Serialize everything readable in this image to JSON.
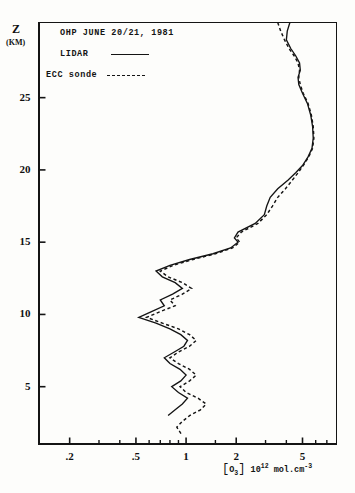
{
  "figure": {
    "y_axis_title": "Z",
    "y_axis_unit": "(KM)",
    "x_axis_caption_species": "O",
    "x_axis_caption_sub": "3",
    "x_axis_caption_factor": "10",
    "x_axis_caption_exp": "12",
    "x_axis_caption_units": "mol.cm",
    "x_axis_caption_units_exp": "-3"
  },
  "legend": {
    "title": "OHP JUNE 20/21, 1981",
    "series": [
      {
        "label": "LIDAR",
        "style": "solid"
      },
      {
        "label": "ECC sonde",
        "style": "dashed"
      }
    ]
  },
  "chart_data": {
    "type": "line",
    "title": "OHP JUNE 20/21, 1981",
    "xlabel": "[O3] 10^12 mol.cm^-3",
    "ylabel": "Z (KM)",
    "xscale": "log",
    "xlim": [
      0.13,
      8.0
    ],
    "ylim": [
      1.0,
      30.2
    ],
    "grid": false,
    "legend_position": "upper-left",
    "xticks": [
      0.2,
      0.5,
      1,
      2,
      5
    ],
    "xtick_labels": [
      ".2",
      ".5",
      "1",
      "2",
      "5"
    ],
    "xminor_ticks": [
      0.3,
      0.4,
      0.6,
      0.7,
      0.8,
      0.9,
      1.5,
      3,
      4,
      6,
      7
    ],
    "yticks": [
      5,
      10,
      15,
      20,
      25
    ],
    "ytick_labels": [
      "5",
      "10",
      "15",
      "20",
      "25"
    ],
    "series": [
      {
        "name": "LIDAR",
        "style": "solid",
        "x": [
          4.2,
          4.05,
          4.0,
          4.25,
          4.55,
          4.8,
          4.85,
          4.7,
          4.75,
          5.0,
          5.35,
          5.6,
          5.75,
          5.8,
          5.7,
          5.4,
          5.0,
          4.55,
          4.1,
          3.55,
          3.2,
          3.05,
          2.95,
          2.6,
          2.05,
          1.95,
          2.05,
          1.85,
          1.45,
          1.05,
          0.8,
          0.66,
          0.72,
          0.86,
          0.95,
          0.83,
          0.7,
          0.74,
          0.62,
          0.52,
          0.66,
          0.8,
          0.93,
          1.02,
          0.97,
          0.85,
          0.74,
          0.8,
          0.92,
          1.0,
          0.93,
          0.82,
          0.9,
          1.02,
          0.95,
          0.86,
          0.78
        ],
        "y": [
          30.2,
          29.6,
          29.0,
          28.4,
          27.9,
          27.4,
          26.9,
          26.4,
          25.9,
          25.3,
          24.6,
          23.8,
          23.0,
          22.2,
          21.5,
          20.9,
          20.3,
          19.8,
          19.3,
          18.7,
          18.1,
          17.5,
          16.9,
          16.3,
          15.7,
          15.3,
          15.0,
          14.6,
          14.2,
          13.8,
          13.4,
          13.0,
          12.6,
          12.2,
          11.8,
          11.4,
          11.0,
          10.6,
          10.2,
          9.8,
          9.4,
          9.0,
          8.6,
          8.2,
          7.8,
          7.4,
          7.0,
          6.6,
          6.2,
          5.8,
          5.4,
          5.0,
          4.6,
          4.2,
          3.8,
          3.4,
          3.0
        ]
      },
      {
        "name": "ECC sonde",
        "style": "dashed",
        "x": [
          3.55,
          3.7,
          3.9,
          4.15,
          4.45,
          4.7,
          4.8,
          4.75,
          4.85,
          5.05,
          5.4,
          5.65,
          5.8,
          5.85,
          5.75,
          5.45,
          5.05,
          4.7,
          4.35,
          3.95,
          3.55,
          3.3,
          3.05,
          2.7,
          2.15,
          2.0,
          2.1,
          1.9,
          1.5,
          1.1,
          0.84,
          0.7,
          0.78,
          0.95,
          1.08,
          0.95,
          0.8,
          0.86,
          0.7,
          0.58,
          0.72,
          0.9,
          1.05,
          1.15,
          1.05,
          0.9,
          0.8,
          0.9,
          1.05,
          1.15,
          1.05,
          0.92,
          1.0,
          1.18,
          1.32,
          1.22,
          1.05,
          0.95,
          0.88,
          0.95
        ],
        "y": [
          30.2,
          29.6,
          29.0,
          28.4,
          27.9,
          27.4,
          26.9,
          26.4,
          25.9,
          25.3,
          24.6,
          23.8,
          23.0,
          22.2,
          21.5,
          20.9,
          20.3,
          19.8,
          19.3,
          18.7,
          18.1,
          17.5,
          16.9,
          16.3,
          15.7,
          15.3,
          15.0,
          14.6,
          14.2,
          13.8,
          13.4,
          13.0,
          12.6,
          12.2,
          11.8,
          11.4,
          11.0,
          10.6,
          10.2,
          9.8,
          9.4,
          9.0,
          8.6,
          8.2,
          7.8,
          7.4,
          7.0,
          6.6,
          6.2,
          5.8,
          5.4,
          5.0,
          4.6,
          4.2,
          3.8,
          3.4,
          3.0,
          2.6,
          2.2,
          1.6
        ]
      }
    ]
  }
}
